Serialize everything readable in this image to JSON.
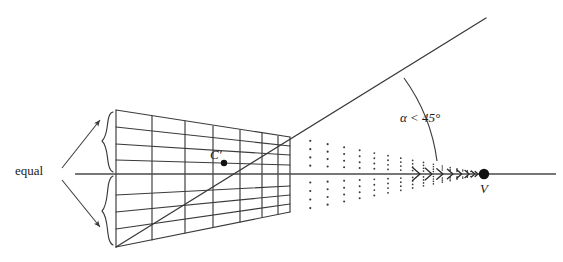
{
  "figure": {
    "width": 563,
    "height": 262,
    "background": "#ffffff",
    "stroke_color": "#3a3a3a",
    "dot_color": "#3a3a3a",
    "text_color": "#1a1a1a"
  },
  "labels": {
    "equal": "equal",
    "center_point": "C′",
    "angle": "α < 45°",
    "vanishing_point": "V"
  },
  "chart_data": {
    "type": "diagram",
    "annotations": [
      {
        "name": "equal",
        "text": "equal",
        "x": 15,
        "y": 174,
        "role": "brace-label"
      },
      {
        "name": "center-point",
        "text": "C′",
        "x": 216,
        "y": 153,
        "role": "point-label"
      },
      {
        "name": "angle",
        "text": "α < 45°",
        "x": 400,
        "y": 119,
        "role": "angle-label"
      },
      {
        "name": "vanishing-point",
        "text": "V",
        "x": 484,
        "y": 190,
        "role": "point-label"
      }
    ],
    "axis": {
      "name": "horizontal-axis",
      "x1": 75,
      "y1": 174,
      "x2": 556,
      "y2": 174
    },
    "vanishing_point": {
      "x": 484,
      "y": 174,
      "radius": 5
    },
    "center_point": {
      "x": 224,
      "y": 163,
      "radius": 3.2
    },
    "grid": {
      "left_edge_x": 116,
      "right_edge_x": 290,
      "left_top_y": 110,
      "left_bottom_y": 247,
      "right_top_y": 137,
      "right_bottom_y": 212,
      "vertical_line_x": [
        116,
        152,
        185,
        213,
        240,
        262,
        278,
        290
      ],
      "horizontal_rows_above_axis": 4,
      "horizontal_rows_below_axis": 4
    },
    "dotted_extension": {
      "start_x": 292,
      "end_x": 474,
      "columns": 17,
      "rows": 8
    },
    "diagonal_ray": {
      "x1": 116,
      "y1": 247,
      "x2": 486,
      "y2": 18
    },
    "angle_arc": {
      "center_x": 484,
      "center_y": 174,
      "radius": 182,
      "from_deg": 0,
      "to_deg": 31.8
    },
    "chevrons": {
      "count": 8,
      "from_x": 420,
      "to_x": 478,
      "y": 174
    },
    "braces": [
      {
        "name": "upper-brace",
        "x": 108,
        "y_top": 112,
        "y_bottom": 172
      },
      {
        "name": "lower-brace",
        "x": 108,
        "y_top": 176,
        "y_bottom": 245
      }
    ],
    "equal_arrows": [
      {
        "from_x": 62,
        "from_y": 168,
        "to_x": 102,
        "to_y": 119
      },
      {
        "from_x": 62,
        "from_y": 180,
        "to_x": 102,
        "to_y": 228
      }
    ]
  }
}
